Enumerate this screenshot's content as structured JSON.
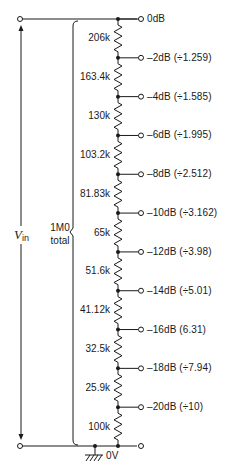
{
  "input_label": {
    "symbol": "V",
    "subscript": "in"
  },
  "total_label": {
    "line1": "1M0",
    "line2": "total"
  },
  "ground_label": "0V",
  "resistors": [
    {
      "value": "206k"
    },
    {
      "value": "163.4k"
    },
    {
      "value": "130k"
    },
    {
      "value": "103.2k"
    },
    {
      "value": "81.83k"
    },
    {
      "value": "65k"
    },
    {
      "value": "51.6k"
    },
    {
      "value": "41.12k"
    },
    {
      "value": "32.5k"
    },
    {
      "value": "25.9k"
    },
    {
      "value": "100k"
    }
  ],
  "taps": [
    {
      "label": "0dB"
    },
    {
      "label": "–2dB (÷1.259)"
    },
    {
      "label": "–4dB (÷1.585)"
    },
    {
      "label": "–6dB (÷1.995)"
    },
    {
      "label": "–8dB (÷2.512)"
    },
    {
      "label": "–10dB (÷3.162)"
    },
    {
      "label": "–12dB (÷3.98)"
    },
    {
      "label": "–14dB (÷5.01)"
    },
    {
      "label": "–16dB (6.31)"
    },
    {
      "label": "–18dB (÷7.94)"
    },
    {
      "label": "–20dB (÷10)"
    }
  ],
  "colors": {
    "line": "#1a1a1a",
    "background": "#ffffff"
  }
}
